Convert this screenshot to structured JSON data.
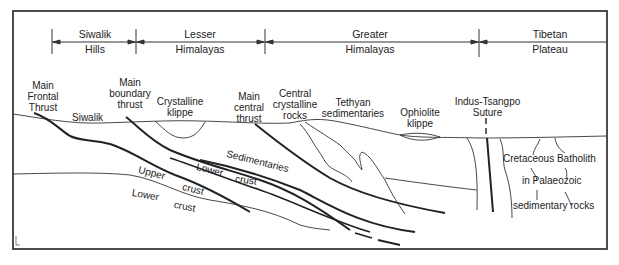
{
  "figure": {
    "type": "geological-cross-section"
  },
  "regions": [
    {
      "line1": "Siwalik",
      "line2": "Hills"
    },
    {
      "line1": "Lesser",
      "line2": "Himalayas"
    },
    {
      "line1": "Greater",
      "line2": "Himalayas"
    },
    {
      "line1": "Tibetan",
      "line2": "Plateau"
    }
  ],
  "structures": {
    "mft": {
      "l1": "Main",
      "l2": "Frontal",
      "l3": "Thrust"
    },
    "mbt": {
      "l1": "Main",
      "l2": "boundary",
      "l3": "thrust"
    },
    "crystalline_klippe": {
      "l1": "Crystalline",
      "l2": "klippe"
    },
    "mct": {
      "l1": "Main",
      "l2": "central",
      "l3": "thrust"
    },
    "ccr": {
      "l1": "Central",
      "l2": "crystalline",
      "l3": "rocks"
    },
    "tethyan": {
      "l1": "Tethyan",
      "l2": "sedimentaries"
    },
    "ophiolite": {
      "l1": "Ophiolite",
      "l2": "klippe"
    },
    "suture": {
      "l1": "Indus-Tsangpo",
      "l2": "Suture"
    }
  },
  "units": {
    "siwalik": "Siwalik",
    "sedimentaries": "Sedimentaries",
    "lower_crust_slab": "Lower",
    "lower_crust_slab_2": "crust",
    "upper_crust": "Upper",
    "upper_crust_2": "crust",
    "lower_crust": "Lower",
    "lower_crust_2": "crust",
    "batholith_1": "Cretaceous Batholith",
    "batholith_2": "in Palaeozoic",
    "batholith_3": "sedimentary rocks"
  }
}
